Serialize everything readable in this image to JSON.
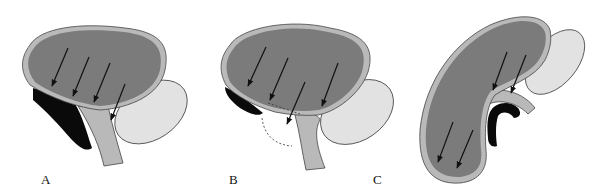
{
  "figure": {
    "panels": [
      {
        "id": "A",
        "label": "A",
        "description": "Bladder with four arrows pressing down toward the outlet; black posterior layer; light gray oval structure at right"
      },
      {
        "id": "B",
        "label": "B",
        "description": "Bladder with five arrows; dashed line across the lower region; dashed outline below; small black layer on left"
      },
      {
        "id": "C",
        "label": "C",
        "description": "Elongated tilted bladder with two arrows at bottom and two arrows at the curved outlet; black curved layer under outlet"
      }
    ],
    "colors": {
      "organ_fill": "#7b7b7b",
      "organ_rim": "#b9b9b9",
      "outline": "#333333",
      "oval_fill": "#e2e2e2",
      "dark_layer": "#0a0a0a",
      "arrow": "#111111"
    }
  }
}
